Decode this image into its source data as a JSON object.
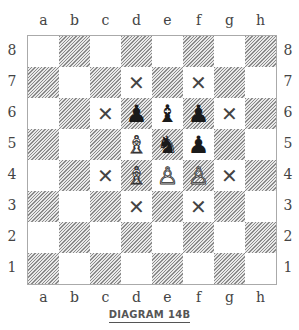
{
  "caption": "DIAGRAM 14B",
  "files": [
    "a",
    "b",
    "c",
    "d",
    "e",
    "f",
    "g",
    "h"
  ],
  "ranks": [
    "8",
    "7",
    "6",
    "5",
    "4",
    "3",
    "2",
    "1"
  ],
  "pieces": [
    {
      "square": "d6",
      "color": "black",
      "type": "pawn",
      "glyph": "♟"
    },
    {
      "square": "e6",
      "color": "black",
      "type": "bishop",
      "glyph": "♝"
    },
    {
      "square": "f6",
      "color": "black",
      "type": "pawn",
      "glyph": "♟"
    },
    {
      "square": "e5",
      "color": "black",
      "type": "knight",
      "glyph": "♞"
    },
    {
      "square": "f5",
      "color": "black",
      "type": "pawn",
      "glyph": "♟"
    },
    {
      "square": "d5",
      "color": "white",
      "type": "bishop",
      "glyph": "♗"
    },
    {
      "square": "d4",
      "color": "white",
      "type": "bishop",
      "glyph": "♗"
    },
    {
      "square": "e4",
      "color": "white",
      "type": "pawn",
      "glyph": "♙"
    },
    {
      "square": "f4",
      "color": "white",
      "type": "pawn",
      "glyph": "♙"
    }
  ],
  "marks": [
    "d7",
    "f7",
    "c6",
    "g6",
    "c4",
    "g4",
    "d3",
    "f3"
  ],
  "mark_glyph": "✕"
}
